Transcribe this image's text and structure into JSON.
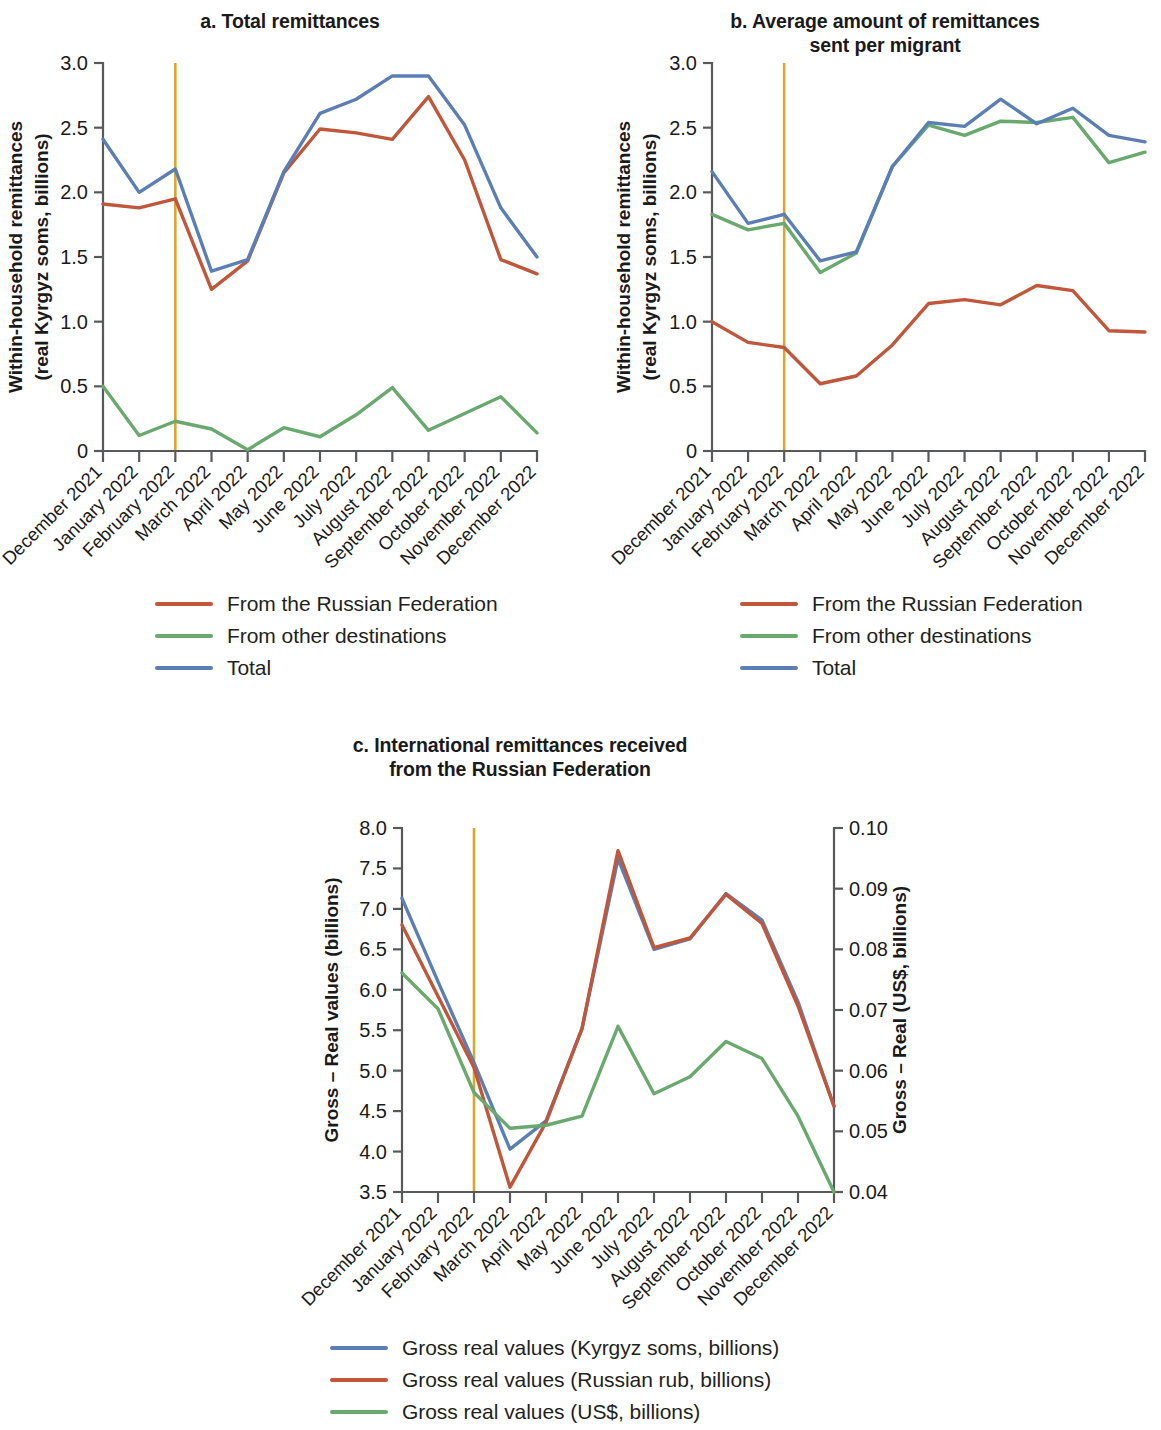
{
  "figure": {
    "background": "#ffffff",
    "colors": {
      "russian_federation": "#c0563a",
      "other_destinations": "#6aa96e",
      "total": "#5b7fb5",
      "kyrgyz_soms": "#5b7fb5",
      "russian_rub": "#c0563a",
      "usd": "#6aa96e",
      "reference_line": "#d9a62e",
      "axis": "#58595b",
      "text": "#231f20"
    },
    "reference_line_category": "February 2022"
  },
  "categories": [
    "December 2021",
    "January 2022",
    "February 2022",
    "March 2022",
    "April 2022",
    "May 2022",
    "June 2022",
    "July 2022",
    "August 2022",
    "September 2022",
    "October 2022",
    "November 2022",
    "December 2022"
  ],
  "chart_data": [
    {
      "id": "panel_a",
      "type": "line",
      "title": "a. Total remittances",
      "xlabel": "",
      "ylabel": "Within-household remittances\n(real Kyrgyz soms, billions)",
      "ylim": [
        0,
        3.0
      ],
      "yticks": [
        0,
        0.5,
        1.0,
        1.5,
        2.0,
        2.5,
        3.0
      ],
      "ytick_labels": [
        "0",
        "0.5",
        "1.0",
        "1.5",
        "2.0",
        "2.5",
        "3.0"
      ],
      "grid": false,
      "legend_position": "below",
      "categories": [
        "December 2021",
        "January 2022",
        "February 2022",
        "March 2022",
        "April 2022",
        "May 2022",
        "June 2022",
        "July 2022",
        "August 2022",
        "September 2022",
        "October 2022",
        "November 2022",
        "December 2022"
      ],
      "series": [
        {
          "name": "From the Russian Federation",
          "color": "#c0563a",
          "values": [
            1.91,
            1.88,
            1.95,
            1.25,
            1.47,
            2.15,
            2.49,
            2.46,
            2.41,
            2.74,
            2.25,
            1.48,
            1.37
          ]
        },
        {
          "name": "From other destinations",
          "color": "#6aa96e",
          "values": [
            0.5,
            0.12,
            0.23,
            0.17,
            0.01,
            0.18,
            0.11,
            0.28,
            0.49,
            0.16,
            0.29,
            0.42,
            0.14
          ]
        },
        {
          "name": "Total",
          "color": "#5b7fb5",
          "values": [
            2.41,
            2.0,
            2.18,
            1.39,
            1.48,
            2.16,
            2.61,
            2.72,
            2.9,
            2.9,
            2.52,
            1.88,
            1.5
          ]
        }
      ]
    },
    {
      "id": "panel_b",
      "type": "line",
      "title": "b. Average amount of remittances\nsent per migrant",
      "xlabel": "",
      "ylabel": "Within-household remittances\n(real Kyrgyz soms, billions)",
      "ylim": [
        0,
        3.0
      ],
      "yticks": [
        0,
        0.5,
        1.0,
        1.5,
        2.0,
        2.5,
        3.0
      ],
      "ytick_labels": [
        "0",
        "0.5",
        "1.0",
        "1.5",
        "2.0",
        "2.5",
        "3.0"
      ],
      "grid": false,
      "legend_position": "below",
      "categories": [
        "December 2021",
        "January 2022",
        "February 2022",
        "March 2022",
        "April 2022",
        "May 2022",
        "June 2022",
        "July 2022",
        "August 2022",
        "September 2022",
        "October 2022",
        "November 2022",
        "December 2022"
      ],
      "series": [
        {
          "name": "From the Russian Federation",
          "color": "#c0563a",
          "values": [
            1.0,
            0.84,
            0.8,
            0.52,
            0.58,
            0.82,
            1.14,
            1.17,
            1.13,
            1.28,
            1.24,
            0.93,
            0.92
          ]
        },
        {
          "name": "From other destinations",
          "color": "#6aa96e",
          "values": [
            1.83,
            1.71,
            1.76,
            1.38,
            1.53,
            2.2,
            2.52,
            2.44,
            2.55,
            2.54,
            2.58,
            2.23,
            2.31
          ]
        },
        {
          "name": "Total",
          "color": "#5b7fb5",
          "values": [
            2.16,
            1.76,
            1.83,
            1.47,
            1.54,
            2.2,
            2.54,
            2.51,
            2.72,
            2.53,
            2.65,
            2.44,
            2.39
          ]
        }
      ]
    },
    {
      "id": "panel_c",
      "type": "line",
      "title": "c. International remittances received\nfrom the Russian Federation",
      "xlabel": "",
      "ylabel": "Gross – Real values (billions)",
      "y2label": "Gross – Real (US$, billions)",
      "ylim": [
        3.5,
        8.0
      ],
      "yticks": [
        3.5,
        4.0,
        4.5,
        5.0,
        5.5,
        6.0,
        6.5,
        7.0,
        7.5,
        8.0
      ],
      "ytick_labels": [
        "3.5",
        "4.0",
        "4.5",
        "5.0",
        "5.5",
        "6.0",
        "6.5",
        "7.0",
        "7.5",
        "8.0"
      ],
      "y2lim": [
        0.04,
        0.1
      ],
      "y2ticks": [
        0.04,
        0.05,
        0.06,
        0.07,
        0.08,
        0.09,
        0.1
      ],
      "y2tick_labels": [
        "0.04",
        "0.05",
        "0.06",
        "0.07",
        "0.08",
        "0.09",
        "0.10"
      ],
      "grid": false,
      "legend_position": "below",
      "categories": [
        "December 2021",
        "January 2022",
        "February 2022",
        "March 2022",
        "April 2022",
        "May 2022",
        "June 2022",
        "July 2022",
        "August 2022",
        "September 2022",
        "October 2022",
        "November 2022",
        "December 2022"
      ],
      "series": [
        {
          "name": "Gross real values (Kyrgyz soms, billions)",
          "color": "#5b7fb5",
          "axis": "left",
          "values": [
            7.13,
            6.1,
            5.1,
            4.03,
            4.38,
            5.52,
            7.62,
            6.5,
            6.63,
            7.19,
            6.86,
            5.85,
            4.56
          ]
        },
        {
          "name": "Gross real values (Russian rub, billions)",
          "color": "#c0563a",
          "axis": "left",
          "values": [
            6.8,
            5.92,
            5.04,
            3.56,
            4.36,
            5.52,
            7.72,
            6.52,
            6.64,
            7.18,
            6.82,
            5.8,
            4.56
          ]
        },
        {
          "name": "Gross real values (US$, billions)",
          "color": "#6aa96e",
          "axis": "right",
          "values": [
            0.0761,
            0.0702,
            0.0564,
            0.0505,
            0.051,
            0.0525,
            0.0673,
            0.0562,
            0.059,
            0.0648,
            0.062,
            0.0525,
            0.04
          ]
        }
      ]
    }
  ],
  "panel_a": {
    "title": "a. Total remittances",
    "ylabel_line1": "Within-household remittances",
    "ylabel_line2": "(real Kyrgyz soms, billions)",
    "legend": [
      {
        "label": "From the Russian Federation",
        "color": "#c0563a"
      },
      {
        "label": "From other destinations",
        "color": "#6aa96e"
      },
      {
        "label": "Total",
        "color": "#5b7fb5"
      }
    ]
  },
  "panel_b": {
    "title_line1": "b. Average amount of remittances",
    "title_line2": "sent per migrant",
    "ylabel_line1": "Within-household remittances",
    "ylabel_line2": "(real Kyrgyz soms, billions)",
    "legend": [
      {
        "label": "From the Russian Federation",
        "color": "#c0563a"
      },
      {
        "label": "From other destinations",
        "color": "#6aa96e"
      },
      {
        "label": "Total",
        "color": "#5b7fb5"
      }
    ]
  },
  "panel_c": {
    "title_line1": "c. International remittances received",
    "title_line2": "from the Russian Federation",
    "ylabel": "Gross – Real values (billions)",
    "y2label": "Gross – Real (US$, billions)",
    "legend": [
      {
        "label": "Gross real values (Kyrgyz soms, billions)",
        "color": "#5b7fb5"
      },
      {
        "label": "Gross real values (Russian rub, billions)",
        "color": "#c0563a"
      },
      {
        "label": "Gross real values (US$, billions)",
        "color": "#6aa96e"
      }
    ]
  }
}
